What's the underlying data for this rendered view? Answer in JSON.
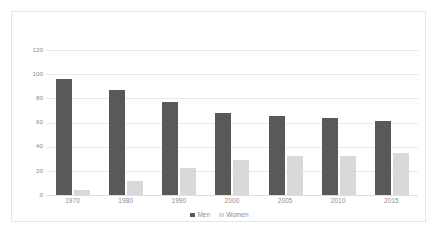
{
  "chart_data": {
    "type": "bar",
    "title": "",
    "subtitle": "",
    "xlabel": "",
    "ylabel": "",
    "categories": [
      "1970",
      "1980",
      "1990",
      "2000",
      "2005",
      "2010",
      "2015"
    ],
    "series": [
      {
        "name": "Men",
        "color": "#595959",
        "values": [
          96,
          87,
          77,
          68,
          65,
          64,
          61
        ]
      },
      {
        "name": "Women",
        "color": "#d9d9d9",
        "values": [
          4,
          12,
          22,
          29,
          32,
          32,
          35
        ]
      }
    ],
    "ylim": [
      0,
      120
    ],
    "yticks": [
      0,
      20,
      40,
      60,
      80,
      100,
      120
    ],
    "ytick_labels": [
      "0",
      "20",
      "40",
      "60",
      "80",
      "100",
      "120"
    ],
    "grid": true,
    "grid_axis": "y",
    "legend": {
      "position": "bottom",
      "entries": [
        "Men",
        "Women"
      ]
    },
    "background_color": "#ffffff",
    "border_color": "#e6e6e6",
    "gridline_color": "#e9e9e9",
    "tick_label_color": "#8c8c8c"
  }
}
